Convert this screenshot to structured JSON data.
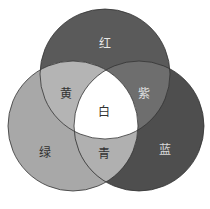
{
  "diagram": {
    "type": "venn-3",
    "circles": [
      {
        "id": "top",
        "label": "红",
        "fill": "#5a5a5a",
        "cx": 105,
        "cy": 74,
        "r": 65
      },
      {
        "id": "left",
        "label": "绿",
        "fill": "#a8a8a8",
        "cx": 73,
        "cy": 126,
        "r": 65
      },
      {
        "id": "right",
        "label": "蓝",
        "fill": "#4e4e4e",
        "cx": 139,
        "cy": 126,
        "r": 65
      }
    ],
    "regions": {
      "red": {
        "label": "红",
        "x": 105,
        "y": 44,
        "color": "#e8e8e8"
      },
      "green": {
        "label": "绿",
        "x": 45,
        "y": 153,
        "color": "#333333"
      },
      "blue": {
        "label": "蓝",
        "x": 165,
        "y": 150,
        "color": "#d8d8d8"
      },
      "yellow": {
        "label": "黄",
        "x": 66,
        "y": 94,
        "color": "#333333",
        "fill": "#b4b4b4"
      },
      "purple": {
        "label": "紫",
        "x": 144,
        "y": 94,
        "color": "#e0e0e0",
        "fill": "#6e6e6e"
      },
      "cyan": {
        "label": "青",
        "x": 104,
        "y": 154,
        "color": "#333333",
        "fill": "#b0b0b0"
      },
      "white": {
        "label": "白",
        "x": 104,
        "y": 112,
        "color": "#333333",
        "fill": "#ffffff"
      }
    },
    "stroke": "#333333"
  }
}
